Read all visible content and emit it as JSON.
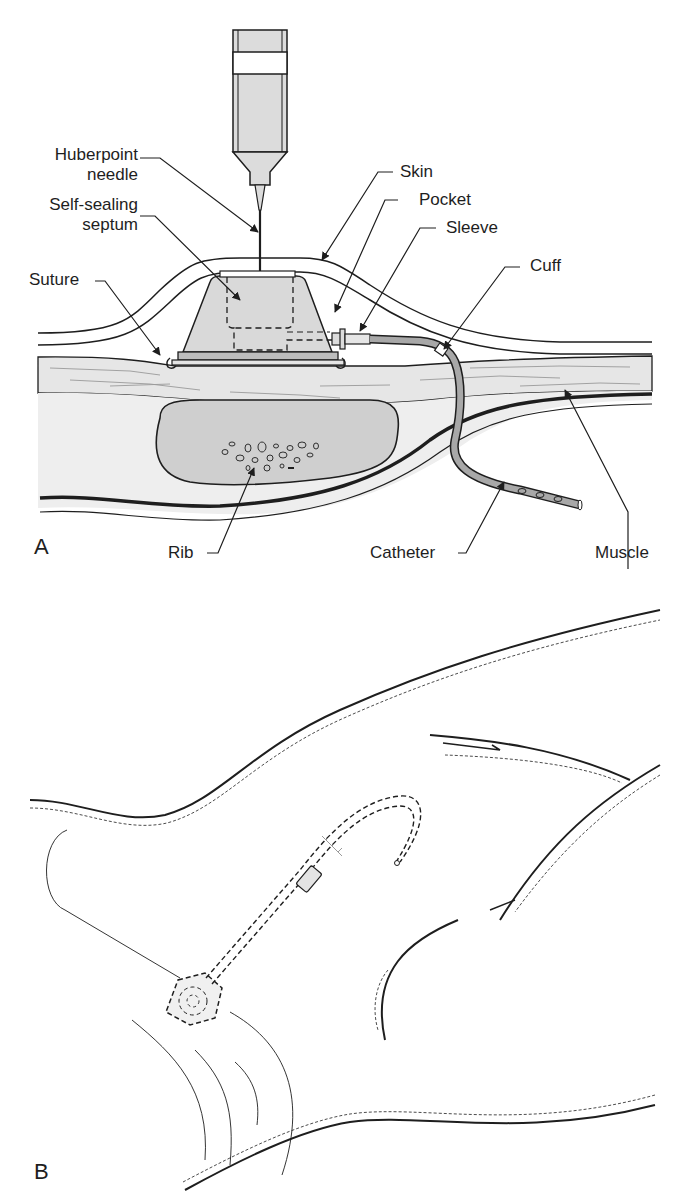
{
  "figure": {
    "panels": [
      {
        "letter": "A",
        "title": "Cross-section of implanted port with Huberpoint needle",
        "labels": {
          "huberpoint_needle_line1": "Huberpoint",
          "huberpoint_needle_line2": "needle",
          "septum_line1": "Self-sealing",
          "septum_line2": "septum",
          "suture": "Suture",
          "skin": "Skin",
          "pocket": "Pocket",
          "sleeve": "Sleeve",
          "cuff": "Cuff",
          "rib": "Rib",
          "catheter": "Catheter",
          "muscle": "Muscle"
        }
      },
      {
        "letter": "B",
        "title": "Port placement on chest wall with tunneled catheter"
      }
    ]
  },
  "colors": {
    "ink": "#1e1e1e",
    "tissue_fill": "#e9e9e9",
    "rib_fill": "#cfcfcf",
    "port_fill": "#d9d9d9",
    "muscle_fibers": "#9a9a9a",
    "catheter_fill": "#a8a8a8",
    "background": "#ffffff"
  }
}
